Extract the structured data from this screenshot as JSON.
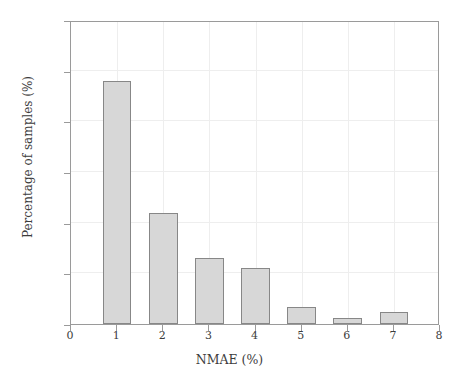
{
  "chart_data": {
    "type": "bar",
    "title": "",
    "xlabel": "NMAE (%)",
    "ylabel": "Percentage of samples (%)",
    "categories": [
      "1",
      "2",
      "3",
      "4",
      "5",
      "6",
      "7"
    ],
    "x": [
      1,
      2,
      3,
      4,
      5,
      6,
      7
    ],
    "values": [
      48,
      22,
      13,
      11,
      3.4,
      1.2,
      2.4
    ],
    "xlim": [
      0,
      8
    ],
    "ylim": [
      0,
      60
    ],
    "xticks": [
      "0",
      "1",
      "2",
      "3",
      "4",
      "5",
      "6",
      "7",
      "8"
    ],
    "yticks": [
      "0",
      "10",
      "20",
      "30",
      "40",
      "50",
      "60"
    ],
    "grid": true,
    "legend": null,
    "bar_fill_color": "#d7d7d7",
    "bar_border_color": "#878787",
    "grid_color": "#eeeeee",
    "axis_color": "#9a9a9a",
    "bar_width_units": 0.62
  },
  "axes": {
    "y_title": "Percentage of samples (%)",
    "x_title": "NMAE (%)",
    "y_tick_labels": [
      "60",
      "50",
      "40",
      "30",
      "20",
      "10",
      "0"
    ],
    "x_tick_labels": [
      "0",
      "1",
      "2",
      "3",
      "4",
      "5",
      "6",
      "7",
      "8"
    ]
  }
}
